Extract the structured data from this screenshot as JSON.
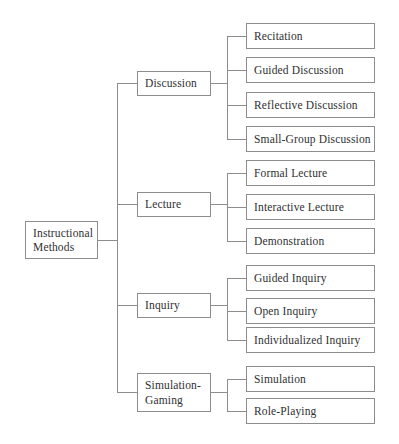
{
  "diagram": {
    "type": "tree-diagram",
    "colors": {
      "background": "#ffffff",
      "box_border": "#8d8d8d",
      "connector_line": "#8d8d8d",
      "text": "#303030"
    },
    "root": {
      "label": "Instructional\nMethods"
    },
    "branches": [
      {
        "label": "Discussion",
        "leaves": [
          {
            "label": "Recitation"
          },
          {
            "label": "Guided Discussion"
          },
          {
            "label": "Reflective Discussion"
          },
          {
            "label": "Small-Group Discussion"
          }
        ]
      },
      {
        "label": "Lecture",
        "leaves": [
          {
            "label": "Formal Lecture"
          },
          {
            "label": "Interactive Lecture"
          },
          {
            "label": "Demonstration"
          }
        ]
      },
      {
        "label": "Inquiry",
        "leaves": [
          {
            "label": "Guided Inquiry"
          },
          {
            "label": "Open Inquiry"
          },
          {
            "label": "Individualized Inquiry"
          }
        ]
      },
      {
        "label": "Simulation-\nGaming",
        "leaves": [
          {
            "label": "Simulation"
          },
          {
            "label": "Role-Playing"
          }
        ]
      }
    ]
  }
}
